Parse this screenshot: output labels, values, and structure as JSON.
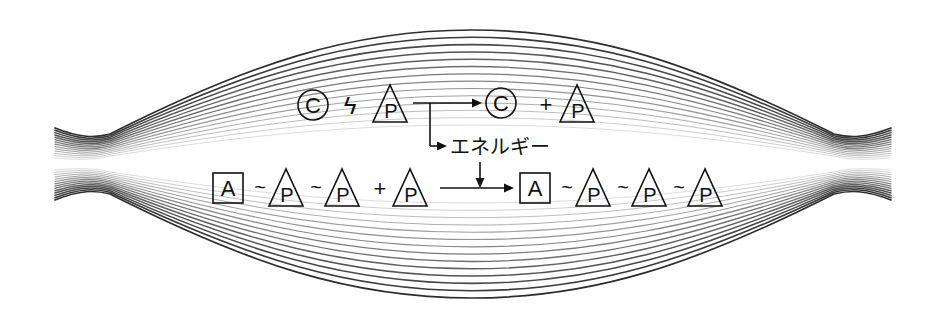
{
  "diagram": {
    "title": "",
    "colors": {
      "ink": "#111111",
      "background": "#ffffff",
      "fiber_lines": "#222222"
    },
    "reaction1": {
      "reactant_a": {
        "shape": "circle",
        "label": "C"
      },
      "bond_symbol": "ϟ",
      "reactant_b": {
        "shape": "triangle",
        "label": "P"
      },
      "product_a": {
        "shape": "circle",
        "label": "C"
      },
      "plus": "+",
      "product_b": {
        "shape": "triangle",
        "label": "P"
      },
      "branch_label": "エネルギー"
    },
    "reaction2": {
      "reactant": [
        {
          "shape": "square",
          "label": "A"
        },
        {
          "shape": "tilde",
          "label": "~"
        },
        {
          "shape": "triangle",
          "label": "P"
        },
        {
          "shape": "tilde",
          "label": "~"
        },
        {
          "shape": "triangle",
          "label": "P"
        }
      ],
      "plus": "+",
      "added": {
        "shape": "triangle",
        "label": "P"
      },
      "product": [
        {
          "shape": "square",
          "label": "A"
        },
        {
          "shape": "tilde",
          "label": "~"
        },
        {
          "shape": "triangle",
          "label": "P"
        },
        {
          "shape": "tilde",
          "label": "~"
        },
        {
          "shape": "triangle",
          "label": "P"
        },
        {
          "shape": "tilde",
          "label": "~"
        },
        {
          "shape": "triangle",
          "label": "P"
        }
      ]
    },
    "fiber_bundle": {
      "line_count": 14,
      "left_end_x": 55,
      "right_end_x": 891
    }
  }
}
